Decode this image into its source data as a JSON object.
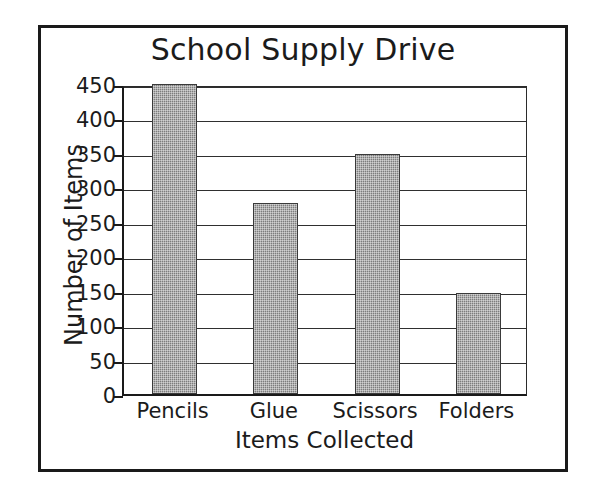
{
  "chart_data": {
    "type": "bar",
    "title": "School Supply Drive",
    "xlabel": "Items Collected",
    "ylabel": "Number of Items",
    "categories": [
      "Pencils",
      "Glue",
      "Scissors",
      "Folders"
    ],
    "values": [
      450,
      277,
      348,
      147
    ],
    "ylim": [
      0,
      450
    ],
    "ytick_values": [
      0,
      50,
      100,
      150,
      200,
      250,
      300,
      350,
      400,
      450
    ],
    "ytick_labels": [
      "0",
      "50",
      "100",
      "150",
      "200",
      "250",
      "300",
      "350",
      "400",
      "450"
    ],
    "ytick_interval": 50,
    "grid": "horizontal",
    "legend": "none",
    "bar_color": "#7d7d7d",
    "bar_edge_color": "#3a3a3a",
    "axis_color": "#1a1a1a",
    "grid_color": "#2f2f2f",
    "background_color": "#ffffff",
    "text_color": "#1b1b1b",
    "frame_color": "#1a1a1a",
    "series": [
      {
        "name": "Number of Items",
        "values": [
          450,
          277,
          348,
          147
        ]
      }
    ],
    "points": [
      {
        "category": "Pencils",
        "value": 450
      },
      {
        "category": "Glue",
        "value": 277
      },
      {
        "category": "Scissors",
        "value": 348
      },
      {
        "category": "Folders",
        "value": 147
      }
    ]
  }
}
